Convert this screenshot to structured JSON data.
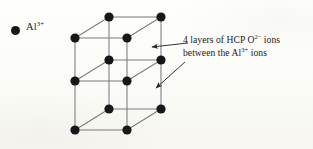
{
  "figure": {
    "background_color": "#fdfdfa",
    "ink_color": "#17171a",
    "line_color": "#6e6e73"
  },
  "legend": {
    "marker_shape": "filled-circle",
    "marker_color": "#17171a",
    "species": "Al",
    "charge": "3+",
    "label_text": "Al",
    "label_superscript": "3+"
  },
  "annotation": {
    "line1_prefix": "4 layers of HCP  O",
    "line1_superscript": "2−",
    "line1_suffix": " ions",
    "line2_prefix": "between the Al",
    "line2_superscript": "3+",
    "line2_suffix": " ions",
    "full_text": "4 layers of HCP O2- ions between the Al3+ ions",
    "layer_count": 4,
    "packing": "HCP",
    "anion": "O2-",
    "cation": "Al3+"
  },
  "lattice": {
    "node_count": 12,
    "layer_count": 3,
    "nodes_per_layer": 4,
    "node_radius": 4.6,
    "node_color": "#17171a",
    "layers": [
      {
        "name": "top-layer",
        "nodes": [
          {
            "name": "top-front-left",
            "x": 75,
            "y": 38
          },
          {
            "name": "top-back-left",
            "x": 109,
            "y": 17
          },
          {
            "name": "top-front-right",
            "x": 127,
            "y": 38
          },
          {
            "name": "top-back-right",
            "x": 161,
            "y": 17
          }
        ]
      },
      {
        "name": "middle-layer",
        "nodes": [
          {
            "name": "mid-front-left",
            "x": 75,
            "y": 81
          },
          {
            "name": "mid-back-left",
            "x": 109,
            "y": 60
          },
          {
            "name": "mid-front-right",
            "x": 127,
            "y": 81
          },
          {
            "name": "mid-back-right",
            "x": 161,
            "y": 60
          }
        ]
      },
      {
        "name": "bottom-layer",
        "nodes": [
          {
            "name": "bot-front-left",
            "x": 75,
            "y": 130
          },
          {
            "name": "bot-back-left",
            "x": 109,
            "y": 109
          },
          {
            "name": "bot-front-right",
            "x": 127,
            "y": 130
          },
          {
            "name": "bot-back-right",
            "x": 161,
            "y": 109
          }
        ]
      }
    ]
  },
  "pointers": [
    {
      "name": "arrow-upper",
      "direction": "left",
      "from_x": 188,
      "from_y": 43,
      "to_x": 152,
      "to_y": 47
    },
    {
      "name": "arrow-lower",
      "direction": "down-left",
      "from_x": 185,
      "from_y": 62,
      "to_x": 156,
      "to_y": 88
    }
  ]
}
